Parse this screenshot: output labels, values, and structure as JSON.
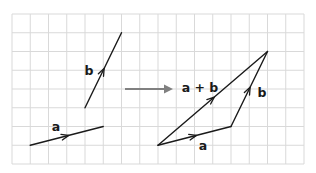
{
  "diagram": {
    "type": "vector-addition",
    "grid": {
      "origin_px": [
        12,
        14
      ],
      "cols": 16,
      "rows": 8,
      "cell_w": 18.25,
      "cell_h": 18.75,
      "line_color": "#d9d9d9"
    },
    "colors": {
      "vector": "#1a1a1a",
      "transform_arrow": "#808080",
      "background": "#ffffff"
    },
    "left": {
      "vectors": [
        {
          "name": "a",
          "label": "a",
          "from": [
            1,
            7
          ],
          "to": [
            5,
            6
          ],
          "label_px": [
            56,
            131
          ]
        },
        {
          "name": "b",
          "label": "b",
          "from": [
            4,
            5
          ],
          "to": [
            6,
            1
          ],
          "label_px": [
            89,
            75
          ]
        }
      ]
    },
    "transform_arrow": {
      "from_px": [
        125,
        89
      ],
      "to_px": [
        173,
        89
      ]
    },
    "right": {
      "vectors": [
        {
          "name": "a",
          "label": "a",
          "from": [
            8,
            7
          ],
          "to": [
            12,
            6
          ],
          "label_px": [
            203,
            150
          ]
        },
        {
          "name": "b",
          "label": "b",
          "from": [
            12,
            6
          ],
          "to": [
            14,
            2
          ],
          "label_px": [
            262,
            97
          ]
        },
        {
          "name": "a-plus-b",
          "label": "a + b",
          "from": [
            8,
            7
          ],
          "to": [
            14,
            2
          ],
          "label_px": [
            200,
            92
          ]
        }
      ]
    }
  }
}
